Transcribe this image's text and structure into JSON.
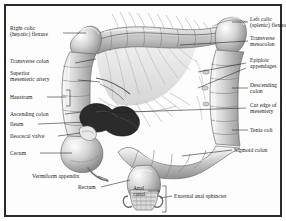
{
  "figure": {
    "style": "grayscale medical illustration with leader-line labels",
    "frame_color": "#2a2a2a",
    "background_color": "#fdfdfd",
    "label_color": "#1a1a1a"
  },
  "labels_left": [
    {
      "id": "right-colic-flexure",
      "text": "Right colic\n(hepatic) flexure"
    },
    {
      "id": "transverse-colon",
      "text": "Transverse colon"
    },
    {
      "id": "superior-mesenteric-artery",
      "text": "Superior\nmesenteric artery"
    },
    {
      "id": "haustrum",
      "text": "Haustrum"
    },
    {
      "id": "ascending-colon",
      "text": "Ascending colon"
    },
    {
      "id": "ileum",
      "text": "Ileum"
    },
    {
      "id": "ileocecal-valve",
      "text": "Ileocecal valve"
    },
    {
      "id": "cecum",
      "text": "Cecum"
    },
    {
      "id": "vermiform-appendix",
      "text": "Vermiform appendix"
    },
    {
      "id": "rectum",
      "text": "Rectum"
    }
  ],
  "labels_right": [
    {
      "id": "left-colic-flexure",
      "text": "Left colic\n(splenic) flexure"
    },
    {
      "id": "transverse-mesocolon",
      "text": "Transverse\nmesocolon"
    },
    {
      "id": "epiploic-appendages",
      "text": "Epiploic\nappendages"
    },
    {
      "id": "descending-colon",
      "text": "Descending\ncolon"
    },
    {
      "id": "cut-edge-of-mesentery",
      "text": "Cut edge of\nmesentery"
    },
    {
      "id": "tenia-coli",
      "text": "Tenia coli"
    },
    {
      "id": "sigmoid-colon",
      "text": "Sigmoid colon"
    },
    {
      "id": "external-anal-sphincter",
      "text": "External anal sphincter"
    }
  ],
  "labels_center": [
    {
      "id": "anal-canal",
      "text": "Anal\ncanal"
    }
  ]
}
